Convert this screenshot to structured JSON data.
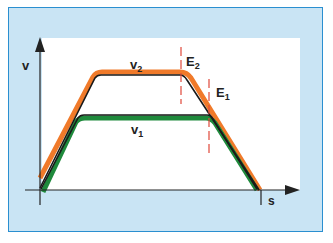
{
  "diagram": {
    "title": "",
    "axes": {
      "y_label": "v",
      "x_label": "s"
    },
    "curves": [
      {
        "name": "v2",
        "label_main": "v",
        "label_sub": "2",
        "color": "#f07a2a"
      },
      {
        "name": "v1",
        "label_main": "v",
        "label_sub": "1",
        "color": "#1f8a3c"
      }
    ],
    "markers": [
      {
        "name": "E2",
        "label_main": "E",
        "label_sub": "2",
        "color": "#e0483a"
      },
      {
        "name": "E1",
        "label_main": "E",
        "label_sub": "1",
        "color": "#e0483a"
      }
    ],
    "colors": {
      "background": "#c9e4f4",
      "border": "#2a8fd0",
      "plot_area": "#ffffff",
      "axis": "#222222",
      "profile_outline": "#1a1a1a"
    }
  }
}
